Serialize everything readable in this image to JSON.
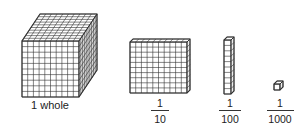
{
  "diagram": {
    "blocks": [
      {
        "name": "cube",
        "label": "1 whole",
        "grid": 10
      },
      {
        "name": "flat",
        "numerator": "1",
        "denominator": "10",
        "grid": 10
      },
      {
        "name": "rod",
        "numerator": "1",
        "denominator": "100",
        "grid": 10
      },
      {
        "name": "unit-cube",
        "numerator": "1",
        "denominator": "1000",
        "grid": 1
      }
    ],
    "colors": {
      "line": "#333333",
      "fill": "#ffffff",
      "side": "#eeeeee"
    }
  }
}
